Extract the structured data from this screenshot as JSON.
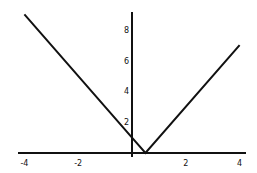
{
  "chart_data": {
    "type": "line",
    "title": "",
    "xlabel": "",
    "ylabel": "",
    "function": "y = |2x - 1|",
    "series": [
      {
        "name": "y = |2x - 1|",
        "x": [
          -4,
          0,
          0.5,
          4
        ],
        "y": [
          9,
          1,
          0,
          7
        ]
      }
    ],
    "xlim": [
      -4.3,
      4.3
    ],
    "ylim": [
      0,
      9.3
    ],
    "xticks": [
      -4,
      -2,
      2,
      4
    ],
    "xtick_labels": [
      "-4",
      "-2",
      "2",
      "4"
    ],
    "yticks": [
      2,
      4,
      6,
      8
    ],
    "ytick_labels": [
      "2",
      "4",
      "6",
      "8"
    ],
    "grid": false,
    "legend": null,
    "line_color": "#111111"
  }
}
